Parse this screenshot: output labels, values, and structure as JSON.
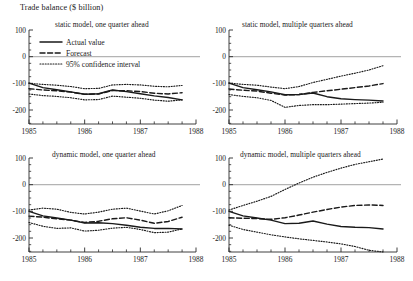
{
  "figure": {
    "title": "Trade balance ($ billion)",
    "y_label": "Trade balance ($ billion)",
    "y_ticks": [
      "100",
      "0",
      "-100",
      "-200"
    ],
    "x_ticks": [
      "1985",
      "1986",
      "1987",
      "1988"
    ]
  },
  "legend": {
    "actual": "Actual value",
    "forecast": "Forecast",
    "ci": "95% confidence interval"
  },
  "panels": {
    "p1": {
      "title": "static model, one quarter ahead"
    },
    "p2": {
      "title": "static model, multiple quarters ahead"
    },
    "p3": {
      "title": "dynamic model, one quarter ahead"
    },
    "p4": {
      "title": "dynamic model, multiple quarters ahead"
    }
  },
  "chart_data": {
    "type": "line",
    "title": "Trade balance ($ billion)",
    "xlabel": "",
    "ylabel": "Trade balance ($ billion)",
    "xlim": [
      1985.0,
      1988.0
    ],
    "ylim": [
      -260,
      100
    ],
    "yticks": [
      100,
      0,
      -100,
      -200
    ],
    "xticks": [
      1985,
      1986,
      1987,
      1988
    ],
    "grid": false,
    "legend_position": "upper-left-panel-1",
    "legend_entries": [
      "Actual value",
      "Forecast",
      "95% confidence interval"
    ],
    "zero_line": 0,
    "panels": [
      {
        "panel": "static model, one quarter ahead",
        "x": [
          1985.0,
          1985.25,
          1985.5,
          1985.75,
          1986.0,
          1986.25,
          1986.5,
          1986.75,
          1987.0,
          1987.25,
          1987.5,
          1987.75
        ],
        "series": [
          {
            "name": "Actual value",
            "style": "solid",
            "values": [
              -99,
              -116,
              -124,
              -132,
              -141,
              -139,
              -125,
              -131,
              -139,
              -147,
              -153,
              -162
            ]
          },
          {
            "name": "Forecast",
            "style": "dashed",
            "values": [
              -120,
              -125,
              -128,
              -133,
              -141,
              -140,
              -127,
              -128,
              -131,
              -137,
              -140,
              -135
            ]
          },
          {
            "name": "95% confidence interval upper",
            "style": "dotted",
            "values": [
              -100,
              -104,
              -107,
              -112,
              -120,
              -119,
              -106,
              -104,
              -106,
              -111,
              -113,
              -108
            ]
          },
          {
            "name": "95% confidence interval lower",
            "style": "dotted",
            "values": [
              -140,
              -146,
              -149,
              -154,
              -162,
              -161,
              -148,
              -152,
              -156,
              -163,
              -167,
              -162
            ]
          }
        ]
      },
      {
        "panel": "static model, multiple quarters ahead",
        "x": [
          1985.0,
          1985.25,
          1985.5,
          1985.75,
          1986.0,
          1986.25,
          1986.5,
          1986.75,
          1987.0,
          1987.25,
          1987.5,
          1987.75
        ],
        "series": [
          {
            "name": "Actual value",
            "style": "solid",
            "values": [
              -99,
              -116,
              -124,
              -132,
              -143,
              -142,
              -136,
              -150,
              -158,
              -161,
              -163,
              -166
            ]
          },
          {
            "name": "Forecast",
            "style": "dashed",
            "values": [
              -121,
              -126,
              -129,
              -137,
              -144,
              -142,
              -134,
              -128,
              -122,
              -116,
              -110,
              -101
            ]
          },
          {
            "name": "95% confidence interval upper",
            "style": "dotted",
            "values": [
              -99,
              -104,
              -107,
              -114,
              -120,
              -112,
              -97,
              -85,
              -73,
              -62,
              -50,
              -34
            ]
          },
          {
            "name": "95% confidence interval lower",
            "style": "dotted",
            "values": [
              -142,
              -149,
              -154,
              -164,
              -190,
              -183,
              -180,
              -180,
              -178,
              -176,
              -174,
              -171
            ]
          }
        ]
      },
      {
        "panel": "dynamic model, one quarter ahead",
        "x": [
          1985.0,
          1985.25,
          1985.5,
          1985.75,
          1986.0,
          1986.25,
          1986.5,
          1986.75,
          1987.0,
          1987.25,
          1987.5,
          1987.75
        ],
        "series": [
          {
            "name": "Actual value",
            "style": "solid",
            "values": [
              -100,
              -117,
              -125,
              -133,
              -144,
              -143,
              -146,
              -152,
              -160,
              -164,
              -164,
              -166
            ]
          },
          {
            "name": "Forecast",
            "style": "dashed",
            "values": [
              -118,
              -122,
              -128,
              -133,
              -142,
              -137,
              -128,
              -124,
              -133,
              -145,
              -138,
              -122
            ]
          },
          {
            "name": "95% confidence interval upper",
            "style": "dotted",
            "values": [
              -95,
              -88,
              -92,
              -104,
              -110,
              -103,
              -92,
              -88,
              -99,
              -110,
              -98,
              -78
            ]
          },
          {
            "name": "95% confidence interval lower",
            "style": "dotted",
            "values": [
              -142,
              -156,
              -164,
              -162,
              -174,
              -171,
              -163,
              -160,
              -168,
              -180,
              -178,
              -166
            ]
          }
        ]
      },
      {
        "panel": "dynamic model, multiple quarters ahead",
        "x": [
          1985.0,
          1985.25,
          1985.5,
          1985.75,
          1986.0,
          1986.25,
          1986.5,
          1986.75,
          1987.0,
          1987.25,
          1987.5,
          1987.75
        ],
        "series": [
          {
            "name": "Actual value",
            "style": "solid",
            "values": [
              -100,
              -117,
              -125,
              -133,
              -146,
              -145,
              -136,
              -148,
              -157,
              -160,
              -161,
              -166
            ]
          },
          {
            "name": "Forecast",
            "style": "dashed",
            "values": [
              -124,
              -126,
              -127,
              -130,
              -124,
              -114,
              -103,
              -93,
              -84,
              -78,
              -76,
              -78
            ]
          },
          {
            "name": "95% confidence interval upper",
            "style": "dotted",
            "values": [
              -95,
              -78,
              -62,
              -44,
              -18,
              6,
              28,
              46,
              62,
              76,
              86,
              96
            ]
          },
          {
            "name": "95% confidence interval lower",
            "style": "dotted",
            "values": [
              -152,
              -168,
              -178,
              -188,
              -196,
              -203,
              -209,
              -215,
              -222,
              -232,
              -246,
              -262
            ]
          }
        ]
      }
    ]
  }
}
